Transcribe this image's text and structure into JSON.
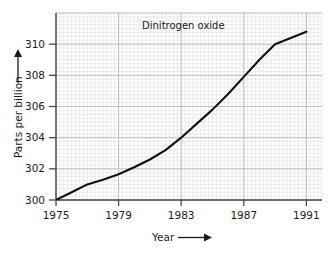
{
  "chart_data": {
    "type": "line",
    "title": "",
    "annotations": [
      {
        "text": "Dinitrogen oxide",
        "x": 1980.5,
        "y": 311.0
      }
    ],
    "series": [
      {
        "name": "Dinitrogen oxide",
        "x": [
          1975,
          1976,
          1977,
          1978,
          1979,
          1980,
          1981,
          1982,
          1983,
          1984,
          1985,
          1986,
          1987,
          1988,
          1989,
          1990,
          1991
        ],
        "values": [
          300.0,
          300.5,
          301.0,
          301.3,
          301.65,
          302.1,
          302.6,
          303.2,
          304.0,
          304.9,
          305.8,
          306.8,
          307.9,
          309.0,
          310.0,
          310.4,
          310.8
        ]
      }
    ],
    "xlabel": "Year",
    "ylabel": "Parts per billion",
    "xlim": [
      1975,
      1992
    ],
    "ylim": [
      300,
      312
    ],
    "xticks": [
      "1975",
      "1979",
      "1983",
      "1987",
      "1991"
    ],
    "xtick_values": [
      1975,
      1979,
      1983,
      1987,
      1991
    ],
    "yticks": [
      "300",
      "302",
      "304",
      "306",
      "308",
      "310"
    ],
    "ytick_values": [
      300,
      302,
      304,
      306,
      308,
      310
    ],
    "grid": true,
    "minor_grid": true,
    "legend": "none",
    "line_color": "#111111",
    "grid_color": "#b9b9c4",
    "minor_grid_color": "#d8d8e0",
    "axis_color": "#4a4a4a"
  },
  "axis": {
    "x_title": "Year",
    "y_title": "Parts per billion",
    "x_arrow": "right-arrow",
    "y_arrow": "up-arrow"
  },
  "label": {
    "series": "Dinitrogen oxide"
  }
}
